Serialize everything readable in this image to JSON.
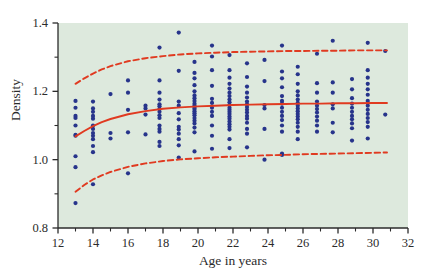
{
  "chart_data": {
    "type": "scatter",
    "title": "",
    "xlabel": "Age in years",
    "ylabel": "Density",
    "xlim": [
      12,
      32
    ],
    "ylim": [
      0.8,
      1.4
    ],
    "xticks": [
      12,
      14,
      16,
      18,
      20,
      22,
      24,
      26,
      28,
      30,
      32
    ],
    "xtick_labels": [
      "12",
      "14",
      "16",
      "18",
      "20",
      "22",
      "24",
      "26",
      "28",
      "30",
      "32"
    ],
    "xminorticks": [
      13,
      15,
      17,
      19,
      21,
      23,
      25,
      27,
      29,
      31
    ],
    "yticks": [
      0.8,
      1.0,
      1.2,
      1.4
    ],
    "ytick_labels": [
      "0.8",
      "1.0",
      "1.2",
      "1.4"
    ],
    "yminorticks": [
      0.9,
      1.1,
      1.3
    ],
    "grid": false,
    "legend": "none",
    "panel_background": "#dde9dd",
    "point_color": "#27348b",
    "curve_color": "#e03a20",
    "point_radius": 2.1,
    "series": [
      {
        "name": "observations",
        "marker": "filled-circle",
        "color": "#27348b",
        "points": [
          [
            13.0,
            0.873
          ],
          [
            13.0,
            0.978
          ],
          [
            13.0,
            1.01
          ],
          [
            13.0,
            1.07
          ],
          [
            13.0,
            1.073
          ],
          [
            13.0,
            1.1
          ],
          [
            13.0,
            1.122
          ],
          [
            13.0,
            1.128
          ],
          [
            13.0,
            1.152
          ],
          [
            13.0,
            1.172
          ],
          [
            14.0,
            0.928
          ],
          [
            14.0,
            1.022
          ],
          [
            14.0,
            1.04
          ],
          [
            14.0,
            1.06
          ],
          [
            14.0,
            1.07
          ],
          [
            14.0,
            1.078
          ],
          [
            14.0,
            1.09
          ],
          [
            14.0,
            1.1
          ],
          [
            14.0,
            1.12
          ],
          [
            14.0,
            1.128
          ],
          [
            14.0,
            1.14
          ],
          [
            14.0,
            1.15
          ],
          [
            14.0,
            1.17
          ],
          [
            15.0,
            1.062
          ],
          [
            15.0,
            1.078
          ],
          [
            15.0,
            1.192
          ],
          [
            16.0,
            0.96
          ],
          [
            16.0,
            1.08
          ],
          [
            16.0,
            1.146
          ],
          [
            16.0,
            1.196
          ],
          [
            16.0,
            1.232
          ],
          [
            17.0,
            1.074
          ],
          [
            17.0,
            1.132
          ],
          [
            17.0,
            1.15
          ],
          [
            17.0,
            1.158
          ],
          [
            17.8,
            1.04
          ],
          [
            17.8,
            1.052
          ],
          [
            17.8,
            1.082
          ],
          [
            17.8,
            1.09
          ],
          [
            17.8,
            1.1
          ],
          [
            17.8,
            1.122
          ],
          [
            17.8,
            1.13
          ],
          [
            17.8,
            1.14
          ],
          [
            17.8,
            1.148
          ],
          [
            17.8,
            1.156
          ],
          [
            17.8,
            1.162
          ],
          [
            17.8,
            1.176
          ],
          [
            17.8,
            1.196
          ],
          [
            17.8,
            1.232
          ],
          [
            17.8,
            1.328
          ],
          [
            18.9,
            1.006
          ],
          [
            18.9,
            1.042
          ],
          [
            18.9,
            1.06
          ],
          [
            18.9,
            1.076
          ],
          [
            18.9,
            1.088
          ],
          [
            18.9,
            1.096
          ],
          [
            18.9,
            1.118
          ],
          [
            18.9,
            1.136
          ],
          [
            18.9,
            1.158
          ],
          [
            18.9,
            1.17
          ],
          [
            18.9,
            1.26
          ],
          [
            18.9,
            1.372
          ],
          [
            19.8,
            1.024
          ],
          [
            19.8,
            1.08
          ],
          [
            19.8,
            1.094
          ],
          [
            19.8,
            1.106
          ],
          [
            19.8,
            1.114
          ],
          [
            19.8,
            1.122
          ],
          [
            19.8,
            1.13
          ],
          [
            19.8,
            1.136
          ],
          [
            19.8,
            1.142
          ],
          [
            19.8,
            1.148
          ],
          [
            19.8,
            1.152
          ],
          [
            19.8,
            1.158
          ],
          [
            19.8,
            1.164
          ],
          [
            19.8,
            1.172
          ],
          [
            19.8,
            1.18
          ],
          [
            19.8,
            1.188
          ],
          [
            19.8,
            1.2
          ],
          [
            19.8,
            1.218
          ],
          [
            19.8,
            1.238
          ],
          [
            19.8,
            1.254
          ],
          [
            19.8,
            1.286
          ],
          [
            20.8,
            1.032
          ],
          [
            20.8,
            1.07
          ],
          [
            20.8,
            1.1
          ],
          [
            20.8,
            1.128
          ],
          [
            20.8,
            1.14
          ],
          [
            20.8,
            1.152
          ],
          [
            20.8,
            1.166
          ],
          [
            20.8,
            1.178
          ],
          [
            20.8,
            1.216
          ],
          [
            20.8,
            1.262
          ],
          [
            20.8,
            1.302
          ],
          [
            20.8,
            1.334
          ],
          [
            21.8,
            1.034
          ],
          [
            21.8,
            1.06
          ],
          [
            21.8,
            1.088
          ],
          [
            21.8,
            1.096
          ],
          [
            21.8,
            1.104
          ],
          [
            21.8,
            1.112
          ],
          [
            21.8,
            1.12
          ],
          [
            21.8,
            1.126
          ],
          [
            21.8,
            1.134
          ],
          [
            21.8,
            1.14
          ],
          [
            21.8,
            1.146
          ],
          [
            21.8,
            1.152
          ],
          [
            21.8,
            1.16
          ],
          [
            21.8,
            1.168
          ],
          [
            21.8,
            1.176
          ],
          [
            21.8,
            1.186
          ],
          [
            21.8,
            1.196
          ],
          [
            21.8,
            1.208
          ],
          [
            21.8,
            1.222
          ],
          [
            21.8,
            1.24
          ],
          [
            21.8,
            1.262
          ],
          [
            21.8,
            1.306
          ],
          [
            22.8,
            1.036
          ],
          [
            22.8,
            1.076
          ],
          [
            22.8,
            1.09
          ],
          [
            22.8,
            1.108
          ],
          [
            22.8,
            1.12
          ],
          [
            22.8,
            1.128
          ],
          [
            22.8,
            1.138
          ],
          [
            22.8,
            1.146
          ],
          [
            22.8,
            1.154
          ],
          [
            22.8,
            1.162
          ],
          [
            22.8,
            1.17
          ],
          [
            22.8,
            1.182
          ],
          [
            22.8,
            1.196
          ],
          [
            22.8,
            1.214
          ],
          [
            22.8,
            1.242
          ],
          [
            22.8,
            1.282
          ],
          [
            23.8,
            1.0
          ],
          [
            23.8,
            1.09
          ],
          [
            23.8,
            1.15
          ],
          [
            23.8,
            1.16
          ],
          [
            23.8,
            1.23
          ],
          [
            23.8,
            1.292
          ],
          [
            24.8,
            1.014
          ],
          [
            24.8,
            1.018
          ],
          [
            24.8,
            1.082
          ],
          [
            24.8,
            1.1
          ],
          [
            24.8,
            1.116
          ],
          [
            24.8,
            1.128
          ],
          [
            24.8,
            1.14
          ],
          [
            24.8,
            1.152
          ],
          [
            24.8,
            1.164
          ],
          [
            24.8,
            1.172
          ],
          [
            24.8,
            1.186
          ],
          [
            24.8,
            1.212
          ],
          [
            24.8,
            1.238
          ],
          [
            24.8,
            1.258
          ],
          [
            24.8,
            1.334
          ],
          [
            25.7,
            1.06
          ],
          [
            25.7,
            1.082
          ],
          [
            25.7,
            1.096
          ],
          [
            25.7,
            1.108
          ],
          [
            25.7,
            1.118
          ],
          [
            25.7,
            1.126
          ],
          [
            25.7,
            1.134
          ],
          [
            25.7,
            1.142
          ],
          [
            25.7,
            1.15
          ],
          [
            25.7,
            1.158
          ],
          [
            25.7,
            1.166
          ],
          [
            25.7,
            1.176
          ],
          [
            25.7,
            1.188
          ],
          [
            25.7,
            1.2
          ],
          [
            25.7,
            1.222
          ],
          [
            25.7,
            1.25
          ],
          [
            25.7,
            1.272
          ],
          [
            26.8,
            1.082
          ],
          [
            26.8,
            1.1
          ],
          [
            26.8,
            1.114
          ],
          [
            26.8,
            1.126
          ],
          [
            26.8,
            1.138
          ],
          [
            26.8,
            1.148
          ],
          [
            26.8,
            1.158
          ],
          [
            26.8,
            1.17
          ],
          [
            26.8,
            1.196
          ],
          [
            26.8,
            1.224
          ],
          [
            26.8,
            1.31
          ],
          [
            27.7,
            1.08
          ],
          [
            27.7,
            1.108
          ],
          [
            27.7,
            1.15
          ],
          [
            27.7,
            1.162
          ],
          [
            27.7,
            1.196
          ],
          [
            27.7,
            1.226
          ],
          [
            27.7,
            1.348
          ],
          [
            28.8,
            1.056
          ],
          [
            28.8,
            1.092
          ],
          [
            28.8,
            1.106
          ],
          [
            28.8,
            1.118
          ],
          [
            28.8,
            1.128
          ],
          [
            28.8,
            1.14
          ],
          [
            28.8,
            1.152
          ],
          [
            28.8,
            1.164
          ],
          [
            28.8,
            1.18
          ],
          [
            28.8,
            1.206
          ],
          [
            28.8,
            1.236
          ],
          [
            29.7,
            1.062
          ],
          [
            29.7,
            1.096
          ],
          [
            29.7,
            1.11
          ],
          [
            29.7,
            1.122
          ],
          [
            29.7,
            1.134
          ],
          [
            29.7,
            1.146
          ],
          [
            29.7,
            1.158
          ],
          [
            29.7,
            1.172
          ],
          [
            29.7,
            1.19
          ],
          [
            29.7,
            1.206
          ],
          [
            29.7,
            1.222
          ],
          [
            29.7,
            1.24
          ],
          [
            29.7,
            1.262
          ],
          [
            29.7,
            1.342
          ],
          [
            30.7,
            1.132
          ],
          [
            30.7,
            1.318
          ]
        ]
      }
    ],
    "curves": [
      {
        "name": "upper-confidence-band",
        "style": "dashed",
        "color": "#e03a20",
        "points": [
          [
            13.0,
            1.222
          ],
          [
            13.5,
            1.238
          ],
          [
            14.0,
            1.252
          ],
          [
            14.5,
            1.264
          ],
          [
            15.0,
            1.274
          ],
          [
            16.0,
            1.288
          ],
          [
            17.0,
            1.297
          ],
          [
            18.0,
            1.303
          ],
          [
            19.0,
            1.308
          ],
          [
            20.0,
            1.311
          ],
          [
            21.0,
            1.313
          ],
          [
            22.0,
            1.315
          ],
          [
            23.0,
            1.316
          ],
          [
            24.0,
            1.317
          ],
          [
            25.0,
            1.318
          ],
          [
            26.0,
            1.318
          ],
          [
            27.0,
            1.319
          ],
          [
            28.0,
            1.319
          ],
          [
            29.0,
            1.32
          ],
          [
            30.0,
            1.32
          ],
          [
            30.8,
            1.32
          ]
        ]
      },
      {
        "name": "fitted-mean-curve",
        "style": "solid",
        "color": "#e03a20",
        "points": [
          [
            13.0,
            1.068
          ],
          [
            13.5,
            1.084
          ],
          [
            14.0,
            1.098
          ],
          [
            14.5,
            1.11
          ],
          [
            15.0,
            1.119
          ],
          [
            16.0,
            1.133
          ],
          [
            17.0,
            1.142
          ],
          [
            18.0,
            1.149
          ],
          [
            19.0,
            1.153
          ],
          [
            20.0,
            1.156
          ],
          [
            21.0,
            1.158
          ],
          [
            22.0,
            1.16
          ],
          [
            23.0,
            1.161
          ],
          [
            24.0,
            1.162
          ],
          [
            25.0,
            1.163
          ],
          [
            26.0,
            1.164
          ],
          [
            27.0,
            1.164
          ],
          [
            28.0,
            1.165
          ],
          [
            29.0,
            1.165
          ],
          [
            30.0,
            1.166
          ],
          [
            30.8,
            1.166
          ]
        ]
      },
      {
        "name": "lower-confidence-band",
        "style": "dashed",
        "color": "#e03a20",
        "points": [
          [
            13.0,
            0.906
          ],
          [
            13.5,
            0.926
          ],
          [
            14.0,
            0.942
          ],
          [
            14.5,
            0.954
          ],
          [
            15.0,
            0.964
          ],
          [
            16.0,
            0.979
          ],
          [
            17.0,
            0.989
          ],
          [
            18.0,
            0.996
          ],
          [
            19.0,
            1.001
          ],
          [
            20.0,
            1.004
          ],
          [
            21.0,
            1.007
          ],
          [
            22.0,
            1.009
          ],
          [
            23.0,
            1.011
          ],
          [
            24.0,
            1.013
          ],
          [
            25.0,
            1.014
          ],
          [
            26.0,
            1.016
          ],
          [
            27.0,
            1.017
          ],
          [
            28.0,
            1.018
          ],
          [
            29.0,
            1.019
          ],
          [
            30.0,
            1.02
          ],
          [
            30.8,
            1.021
          ]
        ]
      }
    ]
  }
}
